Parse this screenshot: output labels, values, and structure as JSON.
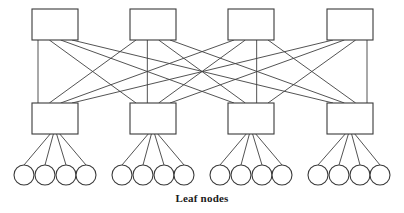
{
  "diagram": {
    "kind": "spine-leaf-network-topology",
    "caption": "Leaf nodes",
    "background_color": "#ffffff",
    "line_color": "#3f3f3f",
    "box_fill_color": "#ffffff",
    "box_stroke_color": "#3a3a3a",
    "caption_color": "#1a1a1a",
    "canvas": {
      "width": 404,
      "height": 213
    }
  },
  "chart_data": {
    "type": "diagram",
    "title": "",
    "layers": [
      {
        "name": "spine-switches",
        "row": 0,
        "count": 4,
        "shape": "rectangle",
        "box": {
          "width": 46,
          "height": 31,
          "y": 9
        },
        "x_positions": [
          32,
          130,
          228,
          327
        ]
      },
      {
        "name": "leaf-switches",
        "row": 1,
        "count": 4,
        "shape": "rectangle",
        "box": {
          "width": 46,
          "height": 31,
          "y": 103
        },
        "x_positions": [
          32,
          130,
          228,
          327
        ]
      },
      {
        "name": "leaf-nodes",
        "row": 2,
        "count": 16,
        "shape": "circle",
        "radius": 10,
        "center_y": 175,
        "per_group": 4,
        "x_positions": [
          24,
          45,
          66,
          86,
          122,
          143,
          164,
          184,
          220,
          241,
          262,
          282,
          318,
          339,
          360,
          380
        ]
      }
    ],
    "edges": {
      "spine_to_leaf": {
        "pattern": "full-mesh",
        "count": 16,
        "description": "every spine switch connects to every leaf switch"
      },
      "leaf_to_node": {
        "pattern": "fan-out",
        "count": 16,
        "description": "each leaf switch connects to its own 4 leaf nodes"
      }
    },
    "legend": [],
    "annotations": [
      {
        "text": "Leaf nodes",
        "x": 202,
        "y": 200,
        "bold": true
      }
    ]
  }
}
